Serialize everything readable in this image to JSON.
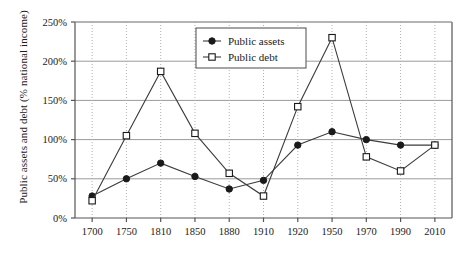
{
  "chart_data": {
    "type": "line",
    "title": "",
    "xlabel": "",
    "ylabel": "Public assets and debt (% national income)",
    "categories": [
      "1700",
      "1750",
      "1810",
      "1850",
      "1880",
      "1910",
      "1920",
      "1950",
      "1970",
      "1990",
      "2010"
    ],
    "x_tick_labels": [
      "1700",
      "1750",
      "1810",
      "1850",
      "1880",
      "1910",
      "1920",
      "1950",
      "1970",
      "1990",
      "2010"
    ],
    "y_tick_labels": [
      "0%",
      "50%",
      "100%",
      "150%",
      "200%",
      "250%"
    ],
    "y_tick_values": [
      0,
      50,
      100,
      150,
      200,
      250
    ],
    "ylim": [
      0,
      250
    ],
    "grid": "vertical dotted gridlines and horizontal solid gridlines",
    "legend_position": "top-center-left inside plot",
    "series": [
      {
        "name": "Public assets",
        "marker": "filled-circle",
        "values": [
          28,
          50,
          70,
          53,
          37,
          48,
          93,
          110,
          100,
          93,
          93
        ]
      },
      {
        "name": "Public debt",
        "marker": "open-square",
        "values": [
          22,
          105,
          187,
          108,
          57,
          28,
          142,
          230,
          78,
          60,
          93
        ]
      }
    ]
  },
  "legend": {
    "items": [
      {
        "label": "Public assets",
        "marker": "filled-circle-marker"
      },
      {
        "label": "Public debt",
        "marker": "open-square-marker"
      }
    ]
  },
  "colors": {
    "line": "#3b3b3b",
    "axis": "#555555",
    "gridline_h": "#9a9a9a",
    "gridline_v": "#b0b0b0",
    "text": "#1a1a1a",
    "background": "#ffffff"
  }
}
